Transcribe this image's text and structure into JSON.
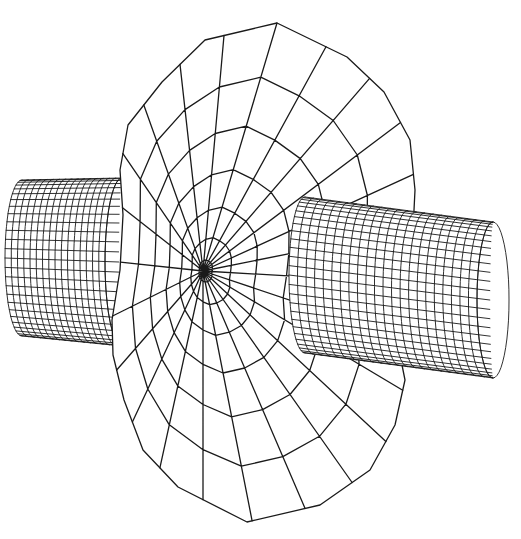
{
  "figure": {
    "type": "wireframe-3d-rendering",
    "background": "#ffffff",
    "line_color": "#1a1a1a",
    "width": 521,
    "height": 539
  },
  "disc": {
    "description": "Faceted ellipsoidal body with polar grid (radial spokes and concentric rings)",
    "pole": {
      "x": 203,
      "y": 271
    },
    "outline": [
      [
        277,
        23
      ],
      [
        205,
        40
      ],
      [
        162,
        82
      ],
      [
        128,
        125
      ],
      [
        120,
        170
      ],
      [
        123,
        215
      ],
      [
        120,
        270
      ],
      [
        112,
        320
      ],
      [
        113,
        355
      ],
      [
        124,
        400
      ],
      [
        143,
        450
      ],
      [
        178,
        487
      ],
      [
        247,
        522
      ],
      [
        320,
        505
      ],
      [
        370,
        470
      ],
      [
        395,
        425
      ],
      [
        405,
        380
      ],
      [
        398,
        345
      ],
      [
        405,
        300
      ],
      [
        412,
        250
      ],
      [
        415,
        190
      ],
      [
        410,
        140
      ],
      [
        384,
        92
      ],
      [
        347,
        57
      ]
    ],
    "rings": 7,
    "spokes": 24,
    "stroke_width": 1.3
  },
  "left_cylinder": {
    "description": "Fine-mesh cylinder protruding left from the disc",
    "back_center": {
      "x": 22,
      "y": 258
    },
    "front_center": {
      "x": 122,
      "y": 262
    },
    "radius_x": 17,
    "radius_y": 78,
    "front_radius_y": 84,
    "rows": 26,
    "cols": 16
  },
  "right_cylinder": {
    "description": "Fine-mesh cylinder protruding right from the disc",
    "back_center": {
      "x": 305,
      "y": 275
    },
    "front_center": {
      "x": 493,
      "y": 300
    },
    "radius_x": 16,
    "radius_y": 78,
    "rows": 26,
    "cols": 22
  }
}
